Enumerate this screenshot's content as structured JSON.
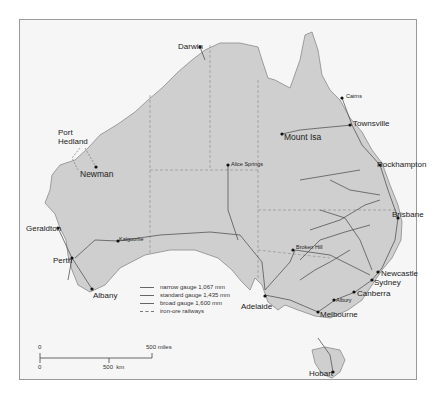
{
  "map": {
    "title": "Australian railways by gauge",
    "colors": {
      "land": "#cfcfcf",
      "sea": "#f6f6f6",
      "rail": "#555555",
      "border": "#9a9a9a"
    },
    "cities": [
      {
        "name": "Darwin",
        "x": 200,
        "y": 47
      },
      {
        "name": "Cairns",
        "x": 342,
        "y": 98
      },
      {
        "name": "Townsville",
        "x": 350,
        "y": 125
      },
      {
        "name": "Mount Isa",
        "x": 282,
        "y": 134
      },
      {
        "name": "Port\nHedland",
        "x": 82,
        "y": 135
      },
      {
        "name": "Newman",
        "x": 96,
        "y": 167
      },
      {
        "name": "Alice Springs",
        "x": 228,
        "y": 164
      },
      {
        "name": "Rockhampton",
        "x": 382,
        "y": 165
      },
      {
        "name": "Brisbane",
        "x": 399,
        "y": 218
      },
      {
        "name": "Geraldton",
        "x": 57,
        "y": 227
      },
      {
        "name": "Kalgoorlie",
        "x": 118,
        "y": 241
      },
      {
        "name": "Broken Hill",
        "x": 293,
        "y": 248
      },
      {
        "name": "Perth",
        "x": 73,
        "y": 259
      },
      {
        "name": "Newcastle",
        "x": 379,
        "y": 271
      },
      {
        "name": "Sydney",
        "x": 372,
        "y": 279
      },
      {
        "name": "Adelaide",
        "x": 267,
        "y": 299
      },
      {
        "name": "Albany",
        "x": 92,
        "y": 289
      },
      {
        "name": "Canberra",
        "x": 354,
        "y": 292
      },
      {
        "name": "Albury",
        "x": 334,
        "y": 299
      },
      {
        "name": "Melbourne",
        "x": 317,
        "y": 312
      },
      {
        "name": "Hobart",
        "x": 333,
        "y": 372
      }
    ],
    "legend": [
      {
        "label": "narrow gauge 1,067 mm",
        "style": "solid"
      },
      {
        "label": "standard gauge 1,435 mm",
        "style": "solid"
      },
      {
        "label": "broad gauge 1,600 mm",
        "style": "solid"
      },
      {
        "label": "iron-ore railways",
        "style": "dashed"
      }
    ],
    "scale": {
      "miles_zero": "0",
      "miles_label": "500 miles",
      "km_zero": "0",
      "km_label": "500  km"
    }
  }
}
